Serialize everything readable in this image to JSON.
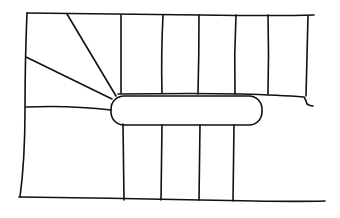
{
  "diagram": {
    "type": "staircase-plan-sketch",
    "style": "hand-drawn line art",
    "colors": {
      "line": "#111111",
      "background": "#ffffff"
    },
    "elements": {
      "outer_wall_top": true,
      "outer_wall_left": true,
      "floor_line_bottom": true,
      "landing_newel": "rounded rectangle",
      "upper_flight_treads": 6,
      "lower_flight_treads": 4,
      "winder_lines": 3
    }
  }
}
